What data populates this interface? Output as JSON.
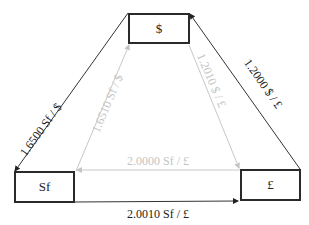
{
  "nodes": {
    "usd": {
      "label": "$"
    },
    "chf": {
      "label": "Sf"
    },
    "gbp": {
      "label": "£"
    }
  },
  "edges": {
    "usd_chf": {
      "label": "1.6500 Sf / $",
      "color": "#222222"
    },
    "gbp_usd": {
      "label": "1.2000 $ / £",
      "color": "#222222"
    },
    "chf_gbp_bottom": {
      "label": "2.0010 Sf / £",
      "color": "#222222"
    },
    "chf_usd_inner": {
      "label": "1.6510 Sf / $",
      "color": "#c4c4c4"
    },
    "usd_gbp_inner": {
      "label": "1.2010 $ / £",
      "color": "#c4c4c4"
    },
    "gbp_chf_inner": {
      "label": "2.0000 Sf / £",
      "color": "#c4c4c4"
    }
  }
}
